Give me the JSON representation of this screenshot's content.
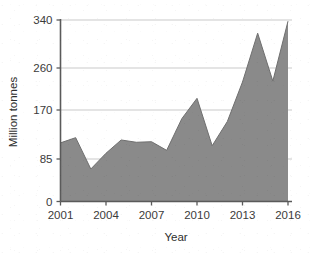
{
  "chart_data": {
    "type": "area",
    "title": "",
    "xlabel": "Year",
    "ylabel": "Million tonnes",
    "grid": "horizontal",
    "legend": "none",
    "xlim": [
      2001,
      2016
    ],
    "ylim": [
      0,
      340
    ],
    "y_ticks": [
      0,
      85,
      170,
      260,
      340
    ],
    "y_tick_labels": [
      "0",
      "85",
      "170",
      "260",
      "340"
    ],
    "x_ticks": [
      2001,
      2004,
      2007,
      2010,
      2013,
      2016
    ],
    "x_tick_labels": [
      "2001",
      "2004",
      "2007",
      "2010",
      "2013",
      "2016"
    ],
    "x": [
      2001,
      2002,
      2003,
      2004,
      2005,
      2006,
      2007,
      2008,
      2009,
      2010,
      2011,
      2012,
      2013,
      2014,
      2015,
      2016
    ],
    "values": [
      113,
      122,
      65,
      95,
      118,
      114,
      115,
      100,
      155,
      195,
      108,
      150,
      230,
      318,
      232,
      338
    ],
    "series": [
      {
        "name": "Million tonnes",
        "values": [
          113,
          122,
          65,
          95,
          118,
          114,
          115,
          100,
          155,
          195,
          108,
          150,
          230,
          318,
          232,
          338
        ]
      }
    ],
    "colors": {
      "area_fill": "#8a8a8a",
      "area_stroke": "#6f6f6f",
      "grid": "#c9c9c9",
      "axis": "#5a5a5a",
      "text": "#3b3b3b",
      "background": "#ffffff"
    }
  }
}
